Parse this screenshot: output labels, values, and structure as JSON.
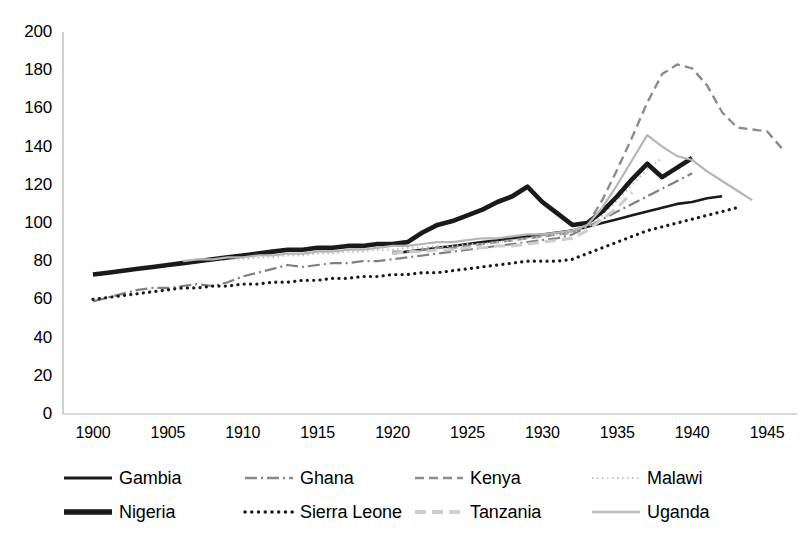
{
  "chart_data": {
    "type": "line",
    "title": "",
    "xlabel": "",
    "ylabel": "",
    "xlim": [
      1898,
      1947
    ],
    "ylim": [
      0,
      200
    ],
    "grid": false,
    "legend_position": "bottom",
    "x_ticks": [
      "1900",
      "1905",
      "1910",
      "1915",
      "1920",
      "1925",
      "1930",
      "1935",
      "1940",
      "1945"
    ],
    "y_ticks": [
      "0",
      "20",
      "40",
      "60",
      "80",
      "100",
      "120",
      "140",
      "160",
      "180",
      "200"
    ],
    "series": [
      {
        "name": "Gambia",
        "style": "solid",
        "color": "#1a1a1a",
        "width": 2.6,
        "x": [
          1920,
          1921,
          1922,
          1923,
          1924,
          1925,
          1926,
          1927,
          1928,
          1929,
          1930,
          1931,
          1932,
          1933,
          1934,
          1935,
          1936,
          1937,
          1938,
          1939,
          1940,
          1941,
          1942
        ],
        "values": [
          84,
          85,
          86,
          87,
          88,
          89,
          90,
          91,
          92,
          93,
          94,
          95,
          96,
          98,
          100,
          102,
          104,
          106,
          108,
          110,
          111,
          113,
          114
        ]
      },
      {
        "name": "Ghana",
        "style": "dashdot",
        "color": "#808080",
        "width": 2.2,
        "x": [
          1900,
          1901,
          1902,
          1903,
          1904,
          1905,
          1906,
          1907,
          1908,
          1909,
          1910,
          1911,
          1912,
          1913,
          1914,
          1915,
          1916,
          1917,
          1918,
          1919,
          1920,
          1921,
          1922,
          1923,
          1924,
          1925,
          1926,
          1927,
          1928,
          1929,
          1930,
          1931,
          1932,
          1933,
          1934,
          1935,
          1936,
          1937,
          1938,
          1939,
          1940
        ],
        "values": [
          59,
          61,
          63,
          65,
          66,
          66,
          67,
          68,
          67,
          69,
          72,
          74,
          76,
          78,
          77,
          78,
          79,
          79,
          80,
          80,
          81,
          82,
          83,
          84,
          85,
          86,
          87,
          88,
          89,
          90,
          91,
          92,
          94,
          98,
          102,
          106,
          110,
          114,
          118,
          122,
          126
        ]
      },
      {
        "name": "Kenya",
        "style": "dashed",
        "color": "#8c8c8c",
        "width": 2.4,
        "x": [
          1920,
          1921,
          1922,
          1923,
          1924,
          1925,
          1926,
          1927,
          1928,
          1929,
          1930,
          1931,
          1932,
          1933,
          1934,
          1935,
          1936,
          1937,
          1938,
          1939,
          1940,
          1941,
          1942,
          1943,
          1944,
          1945,
          1946
        ],
        "values": [
          85,
          85,
          86,
          87,
          87,
          88,
          89,
          90,
          91,
          92,
          93,
          94,
          95,
          99,
          112,
          128,
          145,
          163,
          178,
          183,
          181,
          172,
          158,
          150,
          149,
          148,
          139
        ]
      },
      {
        "name": "Malawi",
        "style": "dotted-fine",
        "color": "#c0c0c0",
        "width": 2.0,
        "x": [
          1907,
          1908,
          1909,
          1910,
          1911,
          1912,
          1913,
          1914,
          1915,
          1916,
          1917,
          1918,
          1919,
          1920,
          1921,
          1922,
          1923,
          1924,
          1925,
          1926,
          1927,
          1928,
          1929,
          1930,
          1931,
          1932,
          1933,
          1934,
          1935,
          1936,
          1937,
          1938
        ],
        "values": [
          80,
          80,
          81,
          81,
          82,
          82,
          83,
          83,
          84,
          84,
          85,
          85,
          86,
          86,
          87,
          87,
          88,
          88,
          89,
          89,
          90,
          91,
          92,
          93,
          94,
          95,
          98,
          104,
          112,
          120,
          128,
          134
        ]
      },
      {
        "name": "Nigeria",
        "style": "solid",
        "color": "#1a1a1a",
        "width": 4.6,
        "x": [
          1900,
          1901,
          1902,
          1903,
          1904,
          1905,
          1906,
          1907,
          1908,
          1909,
          1910,
          1911,
          1912,
          1913,
          1914,
          1915,
          1916,
          1917,
          1918,
          1919,
          1920,
          1921,
          1922,
          1923,
          1924,
          1925,
          1926,
          1927,
          1928,
          1929,
          1930,
          1931,
          1932,
          1933,
          1934,
          1935,
          1936,
          1937,
          1938,
          1939,
          1940
        ],
        "values": [
          73,
          74,
          75,
          76,
          77,
          78,
          79,
          80,
          81,
          82,
          83,
          84,
          85,
          86,
          86,
          87,
          87,
          88,
          88,
          89,
          89,
          90,
          95,
          99,
          101,
          104,
          107,
          111,
          114,
          119,
          111,
          105,
          99,
          100,
          106,
          114,
          123,
          131,
          124,
          129,
          134
        ]
      },
      {
        "name": "Sierra Leone",
        "style": "dotted",
        "color": "#1a1a1a",
        "width": 3.2,
        "x": [
          1900,
          1901,
          1902,
          1903,
          1904,
          1905,
          1906,
          1907,
          1908,
          1909,
          1910,
          1911,
          1912,
          1913,
          1914,
          1915,
          1916,
          1917,
          1918,
          1919,
          1920,
          1921,
          1922,
          1923,
          1924,
          1925,
          1926,
          1927,
          1928,
          1929,
          1930,
          1931,
          1932,
          1933,
          1934,
          1935,
          1936,
          1937,
          1938,
          1939,
          1940,
          1941,
          1942,
          1943
        ],
        "values": [
          60,
          61,
          62,
          63,
          64,
          65,
          66,
          66,
          67,
          67,
          68,
          68,
          69,
          69,
          70,
          70,
          71,
          71,
          72,
          72,
          73,
          73,
          74,
          74,
          75,
          76,
          77,
          78,
          79,
          80,
          80,
          80,
          81,
          84,
          87,
          90,
          93,
          96,
          98,
          100,
          102,
          104,
          106,
          108
        ]
      },
      {
        "name": "Tanzania",
        "style": "dashed-light",
        "color": "#cdcdcd",
        "width": 3.0,
        "x": [
          1920,
          1921,
          1922,
          1923,
          1924,
          1925,
          1926,
          1927,
          1928,
          1929,
          1930,
          1931,
          1932,
          1933,
          1934,
          1935,
          1936
        ],
        "values": [
          84,
          85,
          85,
          86,
          86,
          87,
          87,
          88,
          88,
          89,
          90,
          91,
          92,
          96,
          102,
          108,
          116
        ]
      },
      {
        "name": "Uganda",
        "style": "solid-light",
        "color": "#b5b5b5",
        "width": 2.2,
        "x": [
          1906,
          1907,
          1908,
          1909,
          1910,
          1911,
          1912,
          1913,
          1914,
          1915,
          1916,
          1917,
          1918,
          1919,
          1920,
          1921,
          1922,
          1923,
          1924,
          1925,
          1926,
          1927,
          1928,
          1929,
          1930,
          1931,
          1932,
          1933,
          1934,
          1935,
          1936,
          1937,
          1938,
          1939,
          1940,
          1941,
          1942,
          1943,
          1944
        ],
        "values": [
          80,
          81,
          81,
          82,
          82,
          83,
          83,
          84,
          84,
          85,
          85,
          86,
          86,
          87,
          88,
          88,
          89,
          90,
          90,
          91,
          92,
          92,
          93,
          94,
          94,
          95,
          96,
          99,
          108,
          120,
          133,
          146,
          140,
          135,
          133,
          127,
          122,
          117,
          112
        ]
      }
    ]
  },
  "legend": {
    "rows": [
      [
        {
          "label": "Gambia",
          "style": "solid",
          "color": "#1a1a1a",
          "width": 3
        },
        {
          "label": "Ghana",
          "style": "dashdot",
          "color": "#8a8a8a",
          "width": 2.6
        },
        {
          "label": "Kenya",
          "style": "dashed",
          "color": "#8c8c8c",
          "width": 2.4
        },
        {
          "label": "Malawi",
          "style": "dotted-fine",
          "color": "#c6c6c6",
          "width": 2.2
        }
      ],
      [
        {
          "label": "Nigeria",
          "style": "solid",
          "color": "#1a1a1a",
          "width": 5.4
        },
        {
          "label": "Sierra Leone",
          "style": "dotted",
          "color": "#1a1a1a",
          "width": 3.4
        },
        {
          "label": "Tanzania",
          "style": "dashed-light",
          "color": "#cfcfcf",
          "width": 4
        },
        {
          "label": "Uganda",
          "style": "solid-light",
          "color": "#bdbdbd",
          "width": 2.6
        }
      ]
    ]
  },
  "axis": {
    "line_color": "#b0b0b0"
  }
}
